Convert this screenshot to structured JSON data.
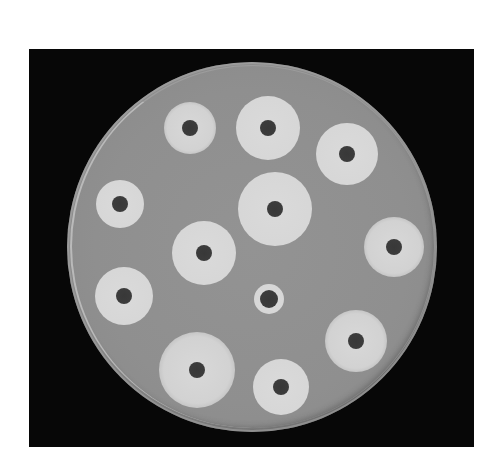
{
  "image": {
    "subject": "Petri dish antibiotic disk diffusion test (zones of inhibition)",
    "background_color": "#ffffff",
    "frame_color": "#070707",
    "agar_color": "#8f8f8f",
    "zone_color": "#d8d8d8",
    "disk_color": "#3a3a3a"
  },
  "dish": {
    "center_x": 252,
    "center_y": 247,
    "radius": 185
  },
  "zones": [
    {
      "id": 1,
      "x": 190,
      "y": 128,
      "zone_r": 26,
      "disk_r": 8,
      "edge": "fuzzy"
    },
    {
      "id": 2,
      "x": 268,
      "y": 128,
      "zone_r": 32,
      "disk_r": 8,
      "edge": "sharp"
    },
    {
      "id": 3,
      "x": 347,
      "y": 154,
      "zone_r": 31,
      "disk_r": 8,
      "edge": "sharp"
    },
    {
      "id": 4,
      "x": 120,
      "y": 204,
      "zone_r": 24,
      "disk_r": 8,
      "edge": "sharp"
    },
    {
      "id": 5,
      "x": 275,
      "y": 209,
      "zone_r": 37,
      "disk_r": 8,
      "edge": "sharp"
    },
    {
      "id": 6,
      "x": 204,
      "y": 253,
      "zone_r": 32,
      "disk_r": 8,
      "edge": "sharp"
    },
    {
      "id": 7,
      "x": 394,
      "y": 247,
      "zone_r": 30,
      "disk_r": 8,
      "edge": "fuzzy"
    },
    {
      "id": 8,
      "x": 124,
      "y": 296,
      "zone_r": 29,
      "disk_r": 8,
      "edge": "sharp"
    },
    {
      "id": 9,
      "x": 269,
      "y": 299,
      "zone_r": 15,
      "disk_r": 9,
      "edge": "sharp"
    },
    {
      "id": 10,
      "x": 197,
      "y": 370,
      "zone_r": 38,
      "disk_r": 8,
      "edge": "fuzzy"
    },
    {
      "id": 11,
      "x": 281,
      "y": 387,
      "zone_r": 28,
      "disk_r": 8,
      "edge": "sharp"
    },
    {
      "id": 12,
      "x": 356,
      "y": 341,
      "zone_r": 31,
      "disk_r": 8,
      "edge": "fuzzy"
    }
  ]
}
